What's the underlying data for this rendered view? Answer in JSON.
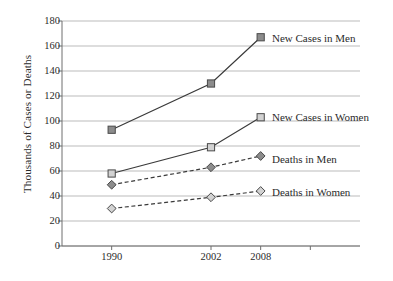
{
  "chart_data": {
    "type": "line",
    "title": "",
    "xlabel": "",
    "ylabel": "Thousands of Cases or Deaths",
    "categories": [
      "1990",
      "2002",
      "2008"
    ],
    "x_positions": [
      1990,
      2002,
      2008
    ],
    "xlim": [
      1984,
      2020
    ],
    "ylim": [
      0,
      180
    ],
    "y_ticks": [
      0,
      20,
      40,
      60,
      80,
      100,
      120,
      140,
      160,
      180
    ],
    "y_tick_labels": [
      "0",
      "20",
      "40",
      "60",
      "80",
      "100",
      "120",
      "140",
      "160",
      "180"
    ],
    "grid": "horizontal",
    "legend": "inline-right-of-last-point",
    "series": [
      {
        "name": "New Cases in Men",
        "values": [
          93,
          130,
          167
        ],
        "marker": "square",
        "marker_fill": "#8c8c8c",
        "line_style": "solid",
        "line_color": "#3a3a3a"
      },
      {
        "name": "New Cases in Women",
        "values": [
          58,
          79,
          103
        ],
        "marker": "square",
        "marker_fill": "#d2d2d2",
        "line_style": "solid",
        "line_color": "#3a3a3a"
      },
      {
        "name": "Deaths in Men",
        "values": [
          49,
          63,
          72
        ],
        "marker": "diamond",
        "marker_fill": "#8c8c8c",
        "line_style": "dashed",
        "line_color": "#3a3a3a"
      },
      {
        "name": "Deaths in Women",
        "values": [
          30,
          39,
          44
        ],
        "marker": "diamond",
        "marker_fill": "#d2d2d2",
        "line_style": "dashed",
        "line_color": "#3a3a3a"
      }
    ]
  },
  "axes": {
    "y_title": "Thousands of Cases or Deaths"
  },
  "colors": {
    "gridline": "#a9a9a9",
    "axis": "#6e6e6e",
    "line": "#3a3a3a",
    "marker_dark": "#8c8c8c",
    "marker_light": "#d2d2d2",
    "marker_edge": "#4a4a4a",
    "text": "#2b2b2b",
    "background": "#ffffff"
  },
  "series_labels": [
    {
      "text": "New Cases in Men",
      "x": 272,
      "y": 33
    },
    {
      "text": "New Cases in Women",
      "x": 272,
      "y": 112
    },
    {
      "text": "Deaths in Men",
      "x": 272,
      "y": 154
    },
    {
      "text": "Deaths in Women",
      "x": 272,
      "y": 187
    }
  ]
}
